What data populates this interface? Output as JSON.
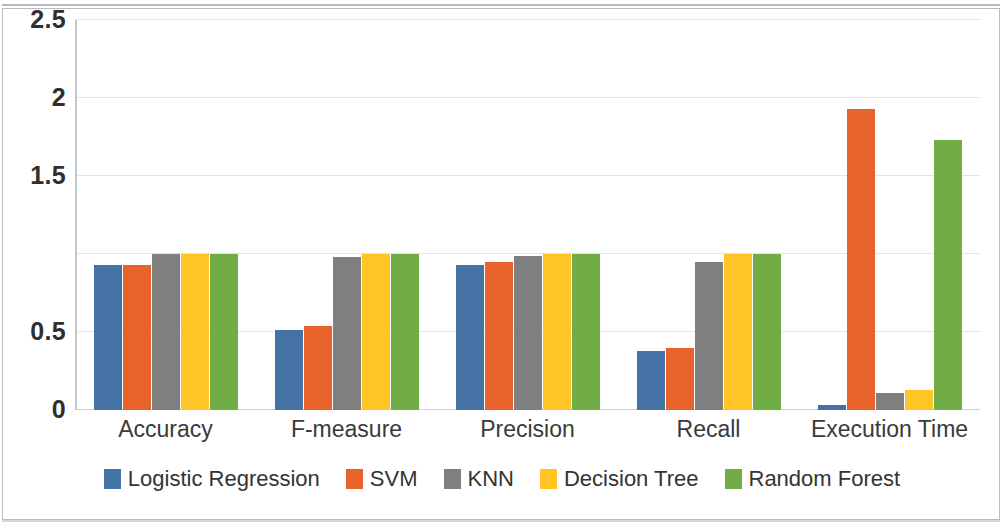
{
  "chart_data": {
    "type": "bar",
    "title": "",
    "subtitle": "",
    "xlabel": "",
    "ylabel": "",
    "ylim": [
      0,
      2.5
    ],
    "yticks": [
      0,
      0.5,
      1,
      1.5,
      2,
      2.5
    ],
    "ytick_labels": [
      "0",
      "0.5",
      "1.5",
      "2",
      "2.5"
    ],
    "grid": true,
    "legend_position": "bottom",
    "categories": [
      "Accuracy",
      "F-measure",
      "Precision",
      "Recall",
      "Execution Time"
    ],
    "series": [
      {
        "name": "Logistic Regression",
        "color": "#4472A4",
        "values": [
          0.93,
          0.51,
          0.93,
          0.38,
          0.03
        ]
      },
      {
        "name": "SVM",
        "color": "#E8622C",
        "values": [
          0.93,
          0.54,
          0.95,
          0.4,
          1.93
        ]
      },
      {
        "name": "KNN",
        "color": "#7F7F7F",
        "values": [
          1.0,
          0.98,
          0.99,
          0.95,
          0.11
        ]
      },
      {
        "name": "Decision Tree",
        "color": "#FFC426",
        "values": [
          1.0,
          1.0,
          1.0,
          1.0,
          0.13
        ]
      },
      {
        "name": "Random Forest",
        "color": "#70AD47",
        "values": [
          1.0,
          1.0,
          1.0,
          1.0,
          1.73
        ]
      }
    ]
  },
  "axis": {
    "ticks": [
      {
        "label": "2.5",
        "value": 2.5
      },
      {
        "label": "2",
        "value": 2
      },
      {
        "label": "1.5",
        "value": 1.5
      },
      {
        "label": "0.5",
        "value": 0.5
      },
      {
        "label": "0",
        "value": 0
      }
    ],
    "gridline_values": [
      2.5,
      2,
      1.5,
      1,
      0.5,
      0
    ]
  },
  "legend": {
    "items": [
      {
        "label": "Logistic Regression",
        "color": "#4472A4"
      },
      {
        "label": "SVM",
        "color": "#E8622C"
      },
      {
        "label": "KNN",
        "color": "#7F7F7F"
      },
      {
        "label": "Decision Tree",
        "color": "#FFC426"
      },
      {
        "label": "Random Forest",
        "color": "#70AD47"
      }
    ]
  }
}
